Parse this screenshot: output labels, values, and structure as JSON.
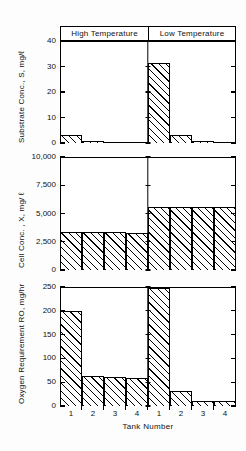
{
  "figure": {
    "xlabel": "Tank  Number",
    "groups": [
      "High  Temperature",
      "Low  Temperature"
    ]
  },
  "chart_data": {
    "type": "bar",
    "title": "",
    "xlabel": "Tank Number",
    "grid": false,
    "legend": "none",
    "groups": [
      "High Temperature",
      "Low Temperature"
    ],
    "categories": [
      "1",
      "2",
      "3",
      "4",
      "1",
      "2",
      "3",
      "4"
    ],
    "panels": [
      {
        "name": "substrate-concentration",
        "ylabel": "Substrate Conc., S, mg/ℓ",
        "ylim": [
          0,
          40
        ],
        "yticks": [
          0,
          10,
          20,
          30,
          40
        ],
        "yticklabels": [
          "0",
          "10",
          "20",
          "30",
          "40"
        ],
        "series": [
          {
            "name": "High Temperature",
            "categories": [
              "1",
              "2",
              "3",
              "4"
            ],
            "values": [
              3.0,
              0.6,
              0.5,
              0.5
            ]
          },
          {
            "name": "Low Temperature",
            "categories": [
              "1",
              "2",
              "3",
              "4"
            ],
            "values": [
              31.5,
              3.0,
              0.6,
              0.5
            ]
          }
        ]
      },
      {
        "name": "cell-concentration",
        "ylabel": "Cell Conc. , X, mg/ ℓ",
        "ylim": [
          0,
          10000
        ],
        "yticks": [
          0,
          2500,
          5000,
          7500,
          10000
        ],
        "yticklabels": [
          "0",
          "2,500",
          "5,000",
          "7,500",
          "10,000"
        ],
        "series": [
          {
            "name": "High Temperature",
            "categories": [
              "1",
              "2",
              "3",
              "4"
            ],
            "values": [
              3400,
              3350,
              3350,
              3300
            ]
          },
          {
            "name": "Low Temperature",
            "categories": [
              "1",
              "2",
              "3",
              "4"
            ],
            "values": [
              5600,
              5600,
              5600,
              5600
            ]
          }
        ]
      },
      {
        "name": "oxygen-requirement",
        "ylabel": "Oxygen Requirement RO, mg/hr",
        "ylim": [
          0,
          250
        ],
        "yticks": [
          0,
          50,
          100,
          150,
          200,
          250
        ],
        "yticklabels": [
          "0",
          "50",
          "100",
          "150",
          "200",
          "250"
        ],
        "series": [
          {
            "name": "High Temperature",
            "categories": [
              "1",
              "2",
              "3",
              "4"
            ],
            "values": [
              200,
              63,
              61,
              59
            ]
          },
          {
            "name": "Low Temperature",
            "categories": [
              "1",
              "2",
              "3",
              "4"
            ],
            "values": [
              248,
              32,
              11,
              10
            ]
          }
        ]
      }
    ]
  }
}
